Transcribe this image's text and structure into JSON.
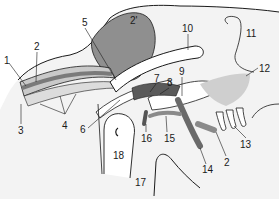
{
  "figure": {
    "background": "#ffffff",
    "colors": {
      "outline": "#1a1a1a",
      "dark_fill": "#8a8a8a",
      "mid_fill": "#b5b5b5",
      "light_fill": "#e6e6e6",
      "stipple": "#d0d0d0"
    },
    "labels": [
      {
        "id": "l1",
        "text": "1",
        "x": 4,
        "y": 56
      },
      {
        "id": "l2",
        "text": "2",
        "x": 34,
        "y": 42
      },
      {
        "id": "l2p",
        "text": "2'",
        "x": 130,
        "y": 16
      },
      {
        "id": "l3",
        "text": "3",
        "x": 18,
        "y": 126
      },
      {
        "id": "l4",
        "text": "4",
        "x": 62,
        "y": 121
      },
      {
        "id": "l5",
        "text": "5",
        "x": 82,
        "y": 18
      },
      {
        "id": "l6",
        "text": "6",
        "x": 80,
        "y": 125
      },
      {
        "id": "l7",
        "text": "7",
        "x": 154,
        "y": 74
      },
      {
        "id": "l8",
        "text": "8",
        "x": 167,
        "y": 78
      },
      {
        "id": "l9",
        "text": "9",
        "x": 179,
        "y": 67
      },
      {
        "id": "l10",
        "text": "10",
        "x": 182,
        "y": 24
      },
      {
        "id": "l11",
        "text": "11",
        "x": 246,
        "y": 29
      },
      {
        "id": "l12",
        "text": "12",
        "x": 259,
        "y": 64
      },
      {
        "id": "l13",
        "text": "13",
        "x": 240,
        "y": 140
      },
      {
        "id": "l14",
        "text": "14",
        "x": 202,
        "y": 165
      },
      {
        "id": "l15",
        "text": "15",
        "x": 164,
        "y": 134
      },
      {
        "id": "l16",
        "text": "16",
        "x": 141,
        "y": 134
      },
      {
        "id": "l17",
        "text": "17",
        "x": 135,
        "y": 178
      },
      {
        "id": "l18",
        "text": "18",
        "x": 113,
        "y": 151
      }
    ]
  }
}
